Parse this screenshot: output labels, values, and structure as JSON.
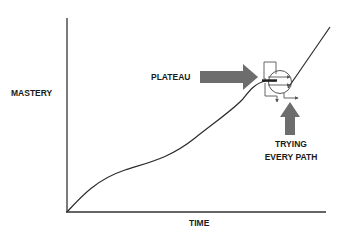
{
  "diagram": {
    "type": "learning-curve",
    "axes": {
      "y_label": "MASTERY",
      "x_label": "TIME"
    },
    "annotations": {
      "plateau": {
        "label": "PLATEAU",
        "arrow_direction": "right"
      },
      "trying": {
        "line1": "TRYING",
        "line2": "EVERY PATH",
        "arrow_direction": "up"
      }
    },
    "colors": {
      "axis": "#333333",
      "curve": "#2b2b2b",
      "arrow_fill": "#6d6d6d",
      "text": "#1a1a1a",
      "paths": "#555555"
    }
  }
}
